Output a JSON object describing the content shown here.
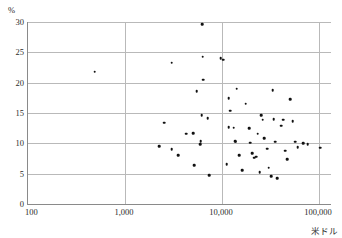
{
  "chart_data": {
    "type": "scatter",
    "title": "",
    "xlabel": "米ドル",
    "ylabel": "%",
    "xscale": "log",
    "xlim": [
      100,
      200000
    ],
    "ylim": [
      0,
      30
    ],
    "grid": true,
    "legend": "none",
    "xticks": [
      "100",
      "1,000",
      "10,000",
      "100,000"
    ],
    "xtick_values": [
      100,
      1000,
      10000,
      100000
    ],
    "yticks": [
      "0",
      "5",
      "10",
      "15",
      "20",
      "25",
      "30"
    ],
    "ytick_values": [
      0,
      5,
      10,
      15,
      20,
      25,
      30
    ],
    "point_color": "#111111",
    "grid_color": "#b9b9b9",
    "axis_color": "#8a8a8a",
    "points": [
      {
        "x": 500,
        "y": 21.8
      },
      {
        "x": 2600,
        "y": 13.4
      },
      {
        "x": 2300,
        "y": 9.5
      },
      {
        "x": 3100,
        "y": 9.0
      },
      {
        "x": 3600,
        "y": 8.0
      },
      {
        "x": 3100,
        "y": 23.3
      },
      {
        "x": 4400,
        "y": 11.6
      },
      {
        "x": 5600,
        "y": 18.6
      },
      {
        "x": 5200,
        "y": 11.7
      },
      {
        "x": 5300,
        "y": 6.4
      },
      {
        "x": 6400,
        "y": 29.6
      },
      {
        "x": 6500,
        "y": 24.3
      },
      {
        "x": 6600,
        "y": 20.5
      },
      {
        "x": 6300,
        "y": 14.6
      },
      {
        "x": 6200,
        "y": 10.4
      },
      {
        "x": 6100,
        "y": 9.9
      },
      {
        "x": 7600,
        "y": 4.7
      },
      {
        "x": 7300,
        "y": 14.1
      },
      {
        "x": 9900,
        "y": 24.0
      },
      {
        "x": 10500,
        "y": 23.8
      },
      {
        "x": 11500,
        "y": 6.6
      },
      {
        "x": 12000,
        "y": 17.4
      },
      {
        "x": 12500,
        "y": 15.4
      },
      {
        "x": 12000,
        "y": 12.7
      },
      {
        "x": 13500,
        "y": 12.6
      },
      {
        "x": 14500,
        "y": 19.0
      },
      {
        "x": 14000,
        "y": 10.4
      },
      {
        "x": 14200,
        "y": 10.3
      },
      {
        "x": 15500,
        "y": 8.0
      },
      {
        "x": 16500,
        "y": 5.6
      },
      {
        "x": 18000,
        "y": 16.5
      },
      {
        "x": 19500,
        "y": 12.5
      },
      {
        "x": 20000,
        "y": 10.1
      },
      {
        "x": 21000,
        "y": 8.4
      },
      {
        "x": 22000,
        "y": 7.6
      },
      {
        "x": 23000,
        "y": 7.8
      },
      {
        "x": 24000,
        "y": 11.6
      },
      {
        "x": 25000,
        "y": 5.2
      },
      {
        "x": 26000,
        "y": 14.6
      },
      {
        "x": 27000,
        "y": 13.9
      },
      {
        "x": 28000,
        "y": 10.8
      },
      {
        "x": 30000,
        "y": 9.1
      },
      {
        "x": 31000,
        "y": 6.0
      },
      {
        "x": 33000,
        "y": 4.6
      },
      {
        "x": 34000,
        "y": 18.8
      },
      {
        "x": 35000,
        "y": 14.0
      },
      {
        "x": 36000,
        "y": 10.3
      },
      {
        "x": 38000,
        "y": 4.3
      },
      {
        "x": 42000,
        "y": 12.9
      },
      {
        "x": 44000,
        "y": 13.9
      },
      {
        "x": 46000,
        "y": 8.8
      },
      {
        "x": 48000,
        "y": 7.4
      },
      {
        "x": 52000,
        "y": 17.3
      },
      {
        "x": 55000,
        "y": 13.6
      },
      {
        "x": 58000,
        "y": 10.3
      },
      {
        "x": 62000,
        "y": 9.4
      },
      {
        "x": 70000,
        "y": 10.0
      },
      {
        "x": 78000,
        "y": 9.9
      },
      {
        "x": 105000,
        "y": 9.3
      }
    ]
  }
}
